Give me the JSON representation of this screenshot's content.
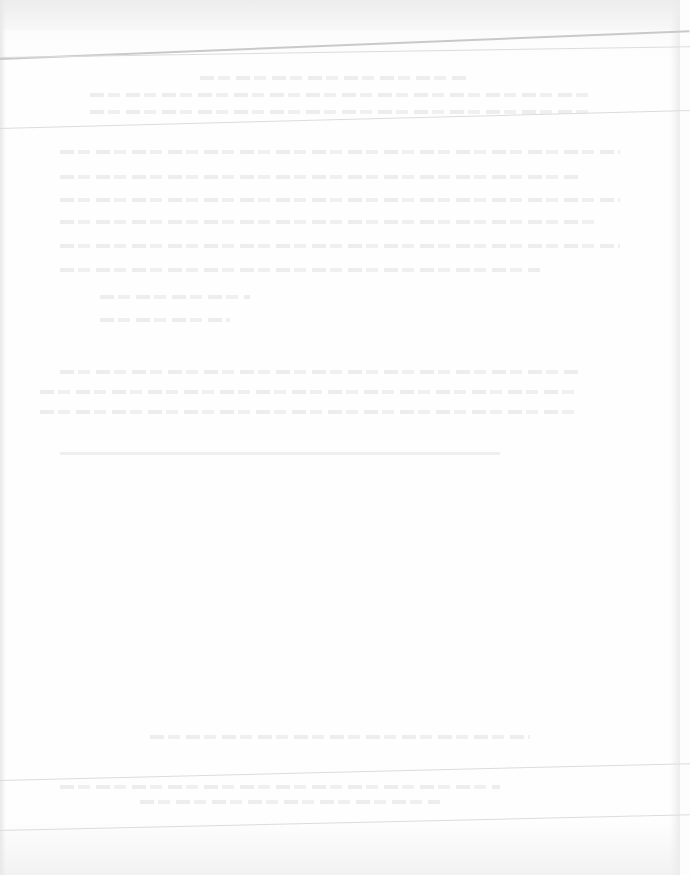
{
  "document": {
    "type": "scanned page (heavily faded, text illegible)",
    "header": {
      "title": "",
      "subtitle": ""
    },
    "body": {
      "paragraphs": []
    },
    "footer": {
      "text": ""
    }
  }
}
